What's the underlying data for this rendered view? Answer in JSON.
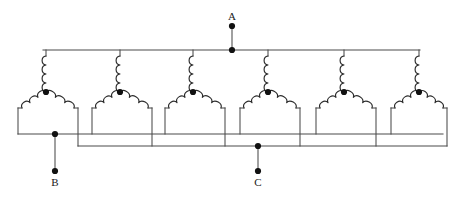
{
  "diagram": {
    "type": "electrical-schematic",
    "width": 462,
    "height": 199,
    "background_color": "#ffffff",
    "wire_color": "#4a4a4a",
    "coil_color": "#2b2b2b",
    "node_color": "#111111",
    "coil_group_count": 6,
    "coils_per_group": 3,
    "total_coils": 18
  },
  "terminals": [
    {
      "id": "A",
      "label": "A",
      "role": "top-phase-terminal",
      "label_x": 232,
      "label_y": 20,
      "stub_dot_x": 232,
      "stub_dot_y": 26,
      "bus_dot_x": 232,
      "bus_dot_y": 50
    },
    {
      "id": "B",
      "label": "B",
      "role": "lower-left-phase-terminal",
      "label_x": 55,
      "label_y": 186,
      "stub_dot_x": 55,
      "stub_dot_y": 171,
      "bus_dot_x": 55,
      "bus_dot_y": 134
    },
    {
      "id": "C",
      "label": "C",
      "role": "lower-center-phase-terminal",
      "label_x": 258,
      "label_y": 186,
      "stub_dot_x": 258,
      "stub_dot_y": 171,
      "bus_dot_x": 258,
      "bus_dot_y": 146
    }
  ],
  "buses": [
    {
      "name": "top-bus-A",
      "terminal": "A",
      "y": 50,
      "x_start": 43,
      "x_end": 420
    },
    {
      "name": "lower-bus-B",
      "terminal": "B",
      "y": 134,
      "x_start": 18,
      "x_end": 443
    },
    {
      "name": "lower-bus-C",
      "terminal": "C",
      "y": 146,
      "x_start": 78,
      "x_end": 447
    }
  ],
  "coil_groups": [
    {
      "index": 1,
      "center_x": 46,
      "node_x": 46,
      "node_y": 92,
      "left_leg_x": 18,
      "right_leg_x": 78,
      "left_leg_bus": "B",
      "right_leg_bus": "C"
    },
    {
      "index": 2,
      "center_x": 120,
      "node_x": 120,
      "node_y": 92,
      "left_leg_x": 92,
      "right_leg_x": 152,
      "left_leg_bus": "B",
      "right_leg_bus": "C"
    },
    {
      "index": 3,
      "center_x": 193,
      "node_x": 193,
      "node_y": 92,
      "left_leg_x": 165,
      "right_leg_x": 225,
      "left_leg_bus": "B",
      "right_leg_bus": "C"
    },
    {
      "index": 4,
      "center_x": 268,
      "node_x": 268,
      "node_y": 92,
      "left_leg_x": 240,
      "right_leg_x": 300,
      "left_leg_bus": "B",
      "right_leg_bus": "C"
    },
    {
      "index": 5,
      "center_x": 344,
      "node_x": 344,
      "node_y": 92,
      "left_leg_x": 316,
      "right_leg_x": 376,
      "left_leg_bus": "B",
      "right_leg_bus": "C"
    },
    {
      "index": 6,
      "center_x": 419,
      "node_x": 419,
      "node_y": 92,
      "left_leg_x": 391,
      "right_leg_x": 447,
      "left_leg_bus": "B",
      "right_leg_bus": "C"
    }
  ]
}
